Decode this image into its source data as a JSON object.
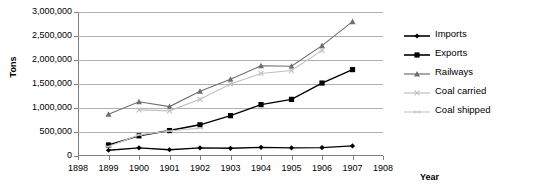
{
  "chart_data": {
    "type": "line",
    "title": "",
    "xlabel": "Year",
    "ylabel": "Tons",
    "x": [
      1899,
      1900,
      1901,
      1902,
      1903,
      1904,
      1905,
      1906,
      1907
    ],
    "xlim": [
      1898,
      1908
    ],
    "ylim": [
      0,
      3000000
    ],
    "xticklabels": [
      "1898",
      "1899",
      "1900",
      "1901",
      "1902",
      "1903",
      "1904",
      "1905",
      "1906",
      "1907",
      "1908"
    ],
    "yticklabels": [
      "0",
      "500,000",
      "1,000,000",
      "1,500,000",
      "2,000,000",
      "2,500,000",
      "3,000,000"
    ],
    "ytickvalues": [
      0,
      500000,
      1000000,
      1500000,
      2000000,
      2500000,
      3000000
    ],
    "grid": true,
    "legend_position": "right",
    "series": [
      {
        "name": "Imports",
        "color": "#000000",
        "marker": "diamond",
        "values": [
          120000,
          170000,
          130000,
          170000,
          160000,
          180000,
          170000,
          175000,
          210000
        ]
      },
      {
        "name": "Exports",
        "color": "#000000",
        "marker": "square",
        "values": [
          230000,
          420000,
          530000,
          650000,
          840000,
          1070000,
          1180000,
          1520000,
          1800000
        ]
      },
      {
        "name": "Railways",
        "color": "#6e6e6e",
        "marker": "triangle",
        "values": [
          870000,
          1130000,
          1030000,
          1350000,
          1600000,
          1880000,
          1870000,
          2300000,
          2800000
        ]
      },
      {
        "name": "Coal carried",
        "color": "#c0c0c0",
        "marker": "x",
        "values": [
          null,
          960000,
          940000,
          1180000,
          1500000,
          1720000,
          1780000,
          2200000,
          null
        ]
      },
      {
        "name": "Coal shipped",
        "color": "#c9c9c9",
        "marker": "dash",
        "values": [
          200000,
          440000,
          520000,
          580000,
          null,
          null,
          null,
          null,
          null
        ]
      }
    ]
  },
  "axis": {
    "y_title": "Tons",
    "x_title": "Year"
  },
  "legend": {
    "items": [
      {
        "label": "Imports"
      },
      {
        "label": "Exports"
      },
      {
        "label": "Railways"
      },
      {
        "label": "Coal carried"
      },
      {
        "label": "Coal shipped"
      }
    ]
  }
}
